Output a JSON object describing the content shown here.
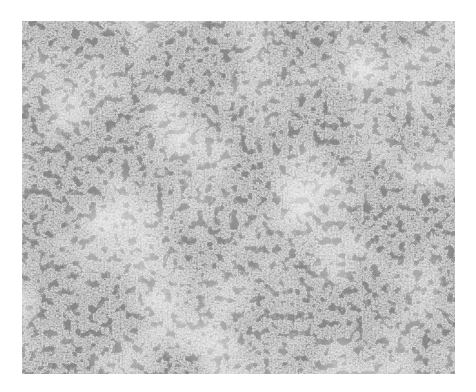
{
  "image": {
    "description": "Grayscale electron micrograph showing densely packed dark granular particles on a lighter fibrous background",
    "palette": {
      "background": "#ffffff",
      "light": "#e6e6e6",
      "mid": "#8a8a8a",
      "dark": "#3a3a3a"
    }
  }
}
